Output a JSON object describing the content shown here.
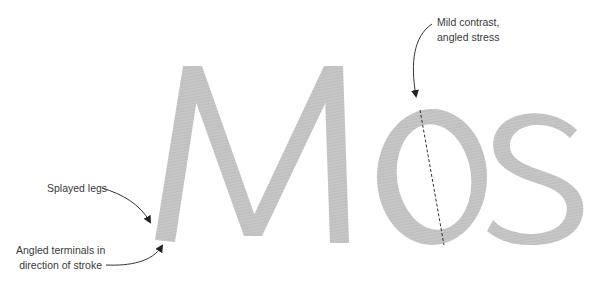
{
  "diagram": {
    "specimen_text": "Mos",
    "glyph_color": "#c4c4c4",
    "annotation_color": "#2b2b2b",
    "annotations": [
      {
        "id": "splayed-legs",
        "lines": [
          "Splayed legs"
        ]
      },
      {
        "id": "angled-terminals",
        "lines": [
          "Angled terminals in",
          "direction of stroke"
        ]
      },
      {
        "id": "angled-stress",
        "lines": [
          "Mild contrast,",
          "angled stress"
        ]
      }
    ]
  }
}
